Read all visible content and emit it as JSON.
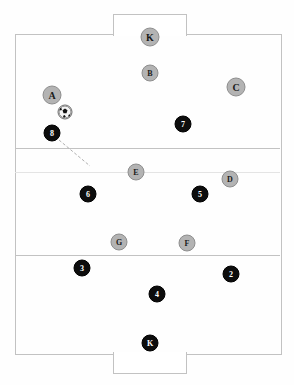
{
  "diagram": {
    "type": "tactical-board"
  },
  "pitch": {
    "x": 15,
    "y": 34,
    "width": 265,
    "height": 319,
    "line_color": "#c2c2c2",
    "zone_lines": [
      {
        "name": "upper-third-line",
        "y": 148,
        "faint": false
      },
      {
        "name": "halfway-line",
        "y": 172,
        "faint": true
      },
      {
        "name": "lower-third-line",
        "y": 255,
        "faint": false
      }
    ],
    "goal_boxes": [
      {
        "name": "top-goal-box",
        "x": 113,
        "y": 14,
        "width": 72,
        "height": 21
      },
      {
        "name": "bottom-goal-box",
        "x": 113,
        "y": 352,
        "width": 72,
        "height": 21
      }
    ]
  },
  "ball": {
    "label": "soccer-ball",
    "x": 65,
    "y": 112,
    "size": 13
  },
  "arrow": {
    "name": "movement-arrow",
    "style": "dashed",
    "color": "#b0b0b0",
    "from_x": 59,
    "from_y": 140,
    "to_x": 90,
    "to_y": 166
  },
  "teams": [
    {
      "name": "lettered-team",
      "color": "#b3b3b3",
      "text_color": "#1a1a1a",
      "players": [
        {
          "label": "K",
          "x": 150,
          "y": 37,
          "size": 17,
          "role": "goalkeeper"
        },
        {
          "label": "B",
          "x": 150,
          "y": 73,
          "size": 15,
          "role": "forward"
        },
        {
          "label": "A",
          "x": 52,
          "y": 95,
          "size": 17,
          "role": "forward"
        },
        {
          "label": "C",
          "x": 236,
          "y": 87,
          "size": 17,
          "role": "forward"
        },
        {
          "label": "E",
          "x": 136,
          "y": 172,
          "size": 15,
          "role": "midfielder"
        },
        {
          "label": "D",
          "x": 230,
          "y": 179,
          "size": 15,
          "role": "midfielder"
        },
        {
          "label": "G",
          "x": 119,
          "y": 242,
          "size": 15,
          "role": "midfielder"
        },
        {
          "label": "F",
          "x": 187,
          "y": 243,
          "size": 15,
          "role": "midfielder"
        }
      ]
    },
    {
      "name": "numbered-team",
      "color": "#0d0d0d",
      "text_color": "#ffffff",
      "players": [
        {
          "label": "7",
          "x": 183,
          "y": 124,
          "size": 15,
          "role": "forward"
        },
        {
          "label": "8",
          "x": 52,
          "y": 133,
          "size": 15,
          "role": "forward"
        },
        {
          "label": "6",
          "x": 88,
          "y": 194,
          "size": 15,
          "role": "midfielder"
        },
        {
          "label": "5",
          "x": 200,
          "y": 194,
          "size": 15,
          "role": "midfielder"
        },
        {
          "label": "3",
          "x": 82,
          "y": 268,
          "size": 15,
          "role": "defender"
        },
        {
          "label": "2",
          "x": 231,
          "y": 274,
          "size": 15,
          "role": "defender"
        },
        {
          "label": "4",
          "x": 157,
          "y": 294,
          "size": 15,
          "role": "defender"
        },
        {
          "label": "K",
          "x": 150,
          "y": 343,
          "size": 15,
          "role": "goalkeeper"
        }
      ]
    }
  ]
}
